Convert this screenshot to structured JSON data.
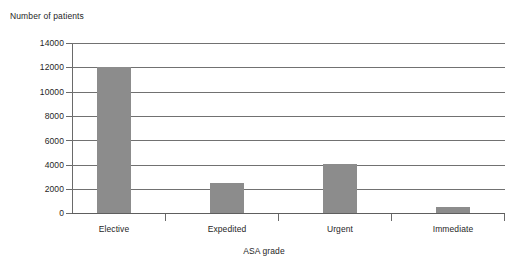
{
  "chart_data": {
    "type": "bar",
    "title": "",
    "ylabel": "Number of patients",
    "xlabel": "ASA grade",
    "categories": [
      "Elective",
      "Expedited",
      "Urgent",
      "Immediate"
    ],
    "values": [
      12050,
      2450,
      4000,
      480
    ],
    "series": [
      {
        "name": "Number of patients",
        "values": [
          12050,
          2450,
          4000,
          480
        ]
      }
    ],
    "ylim": [
      0,
      14000
    ],
    "yticks": [
      0,
      2000,
      4000,
      6000,
      8000,
      10000,
      12000,
      14000
    ],
    "ytick_labels": [
      "0",
      "2000",
      "4000",
      "6000",
      "8000",
      "10000",
      "12000",
      "14000"
    ],
    "grid": "horizontal",
    "legend": "none",
    "bar_color": "#8c8c8c",
    "grid_color": "#717171",
    "axis_color": "#6a6a6a",
    "background": "#ffffff"
  }
}
